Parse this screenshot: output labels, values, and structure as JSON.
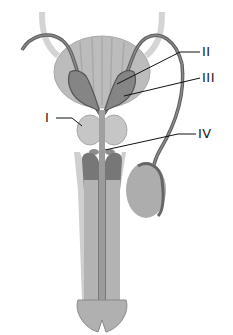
{
  "diagram": {
    "labels": [
      {
        "id": "I",
        "text": "I",
        "points_to": "prostate gland"
      },
      {
        "id": "II",
        "text": "II",
        "points_to": "ejaculatory duct / vas deferens ampulla"
      },
      {
        "id": "III",
        "text": "III",
        "points_to": "seminal vesicle"
      },
      {
        "id": "IV",
        "text": "IV",
        "points_to": "bulbourethral gland"
      }
    ],
    "colors": {
      "background": "#ffffff",
      "bladder": "#b9b9b9",
      "bladder_stripe": "#a9a9a9",
      "vesicle": "#8a8a8a",
      "vesicle_dark": "#5f5f5f",
      "duct": "#6e6e6e",
      "ureter": "#d6d6d6",
      "prostate": "#c8c8c8",
      "testis": "#adadad",
      "shaft": "#b5b5b5",
      "corpus_dark": "#777777",
      "leader_line": "#111111"
    }
  }
}
